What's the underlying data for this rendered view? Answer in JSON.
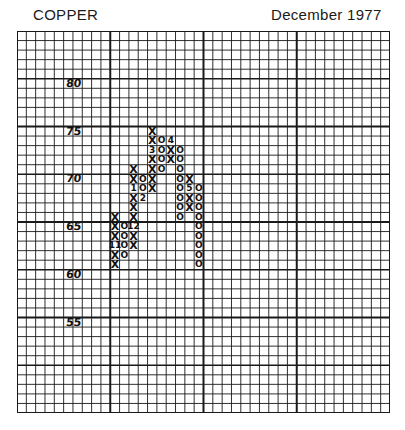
{
  "header": {
    "title": "COPPER",
    "date": "December 1977"
  },
  "chart_data": {
    "type": "point-and-figure",
    "title": "COPPER",
    "subtitle": "December 1977",
    "box_size": 1,
    "ylabel": "Price (cents)",
    "y_tick_labels": [
      "80",
      "75",
      "70",
      "65",
      "60",
      "55"
    ],
    "ylim": [
      45,
      85
    ],
    "grid": true,
    "month_markers_note": "Numerals replace a mark in the month it first occurs (11, 12, 1, 2, 3, 4, 5)",
    "columns": [
      {
        "col": 10,
        "type": "X",
        "from": 61,
        "to": 66,
        "markers": {
          "63": "11"
        }
      },
      {
        "col": 11,
        "type": "O",
        "from": 65,
        "to": 62,
        "markers": {}
      },
      {
        "col": 12,
        "type": "X",
        "from": 63,
        "to": 71,
        "markers": {
          "65": "12",
          "69": "1"
        }
      },
      {
        "col": 13,
        "type": "O",
        "from": 70,
        "to": 68,
        "markers": {
          "68": "2"
        }
      },
      {
        "col": 14,
        "type": "X",
        "from": 69,
        "to": 75,
        "markers": {
          "73": "3"
        }
      },
      {
        "col": 15,
        "type": "O",
        "from": 74,
        "to": 71,
        "markers": {}
      },
      {
        "col": 16,
        "type": "X",
        "from": 72,
        "to": 74,
        "markers": {
          "74": "4"
        }
      },
      {
        "col": 17,
        "type": "O",
        "from": 73,
        "to": 66,
        "markers": {}
      },
      {
        "col": 18,
        "type": "X",
        "from": 67,
        "to": 70,
        "markers": {
          "69": "5"
        }
      },
      {
        "col": 19,
        "type": "O",
        "from": 69,
        "to": 61,
        "markers": {}
      }
    ]
  },
  "y_labels": [
    {
      "text": "80",
      "value": 80
    },
    {
      "text": "75",
      "value": 75
    },
    {
      "text": "70",
      "value": 70
    },
    {
      "text": "65",
      "value": 65
    },
    {
      "text": "60",
      "value": 60
    },
    {
      "text": "55",
      "value": 55
    }
  ]
}
